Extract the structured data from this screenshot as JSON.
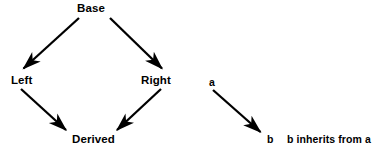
{
  "diagram": {
    "type": "class-inheritance-diagram",
    "background_color": "#ffffff",
    "stroke_color": "#000000",
    "nodes": [
      {
        "id": "base",
        "label": "Base"
      },
      {
        "id": "left",
        "label": "Left"
      },
      {
        "id": "right",
        "label": "Right"
      },
      {
        "id": "derived",
        "label": "Derived"
      }
    ],
    "edges": [
      {
        "from": "base",
        "to": "left",
        "arrow": "solid-filled-head"
      },
      {
        "from": "base",
        "to": "right",
        "arrow": "solid-filled-head"
      },
      {
        "from": "left",
        "to": "derived",
        "arrow": "solid-filled-head"
      },
      {
        "from": "right",
        "to": "derived",
        "arrow": "solid-filled-head"
      }
    ],
    "legend": {
      "source_label": "a",
      "target_label": "b",
      "description": "b inherits from a"
    }
  }
}
